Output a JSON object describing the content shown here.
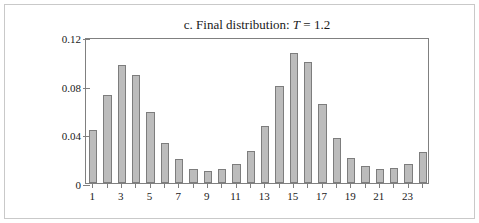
{
  "figure": {
    "panel_label": "c.",
    "title_text": "c. Final distribution: ",
    "title_prefix": "c. Final distribution:",
    "title_variable": "T",
    "title_equals": "= 1.2",
    "border_color": "#c9c9c9"
  },
  "chart_data": {
    "type": "bar",
    "xlabel": "",
    "ylabel": "",
    "ylim": [
      0,
      0.12
    ],
    "yticks": [
      0,
      0.04,
      0.08,
      0.12
    ],
    "ytick_labels": [
      "0",
      "0.04",
      "0.08",
      "0.12"
    ],
    "grid": false,
    "legend": null,
    "categories": [
      1,
      2,
      3,
      4,
      5,
      6,
      7,
      8,
      9,
      10,
      11,
      12,
      13,
      14,
      15,
      16,
      17,
      18,
      19,
      20,
      21,
      22,
      23,
      24
    ],
    "xtick_labels": [
      "1",
      "3",
      "5",
      "7",
      "9",
      "11",
      "13",
      "15",
      "17",
      "19",
      "21",
      "23"
    ],
    "xtick_positions": [
      1,
      3,
      5,
      7,
      9,
      11,
      13,
      15,
      17,
      19,
      21,
      23
    ],
    "values": [
      0.043,
      0.072,
      0.097,
      0.089,
      0.058,
      0.033,
      0.019,
      0.011,
      0.0095,
      0.011,
      0.015,
      0.026,
      0.047,
      0.08,
      0.107,
      0.099,
      0.065,
      0.037,
      0.02,
      0.0135,
      0.011,
      0.012,
      0.0155,
      0.025
    ],
    "bar_fill": "#bcbcbc",
    "bar_edge": "#7d7d7d",
    "axis_color": "#808080"
  }
}
